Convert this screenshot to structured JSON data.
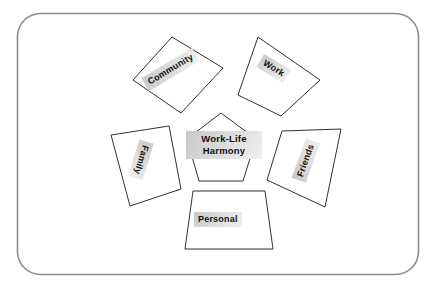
{
  "diagram": {
    "title_text": "Work-Life Harmony",
    "frame": {
      "name": "rounded-border-frame",
      "stroke_color": "#8c8c8c",
      "fill_color": "#ffffff",
      "corner_radius": 22
    },
    "center": {
      "label": "Work-Life Harmony",
      "line1": "Work-Life",
      "line2": "Harmony",
      "shape": "pentagon",
      "rotation_deg": 0
    },
    "nodes": [
      {
        "id": "community",
        "label": "Community",
        "shape": "quadrilateral",
        "rotation_deg": -31,
        "position": "top-left"
      },
      {
        "id": "work",
        "label": "Work",
        "shape": "quadrilateral",
        "rotation_deg": 31,
        "position": "top-right"
      },
      {
        "id": "friends",
        "label": "Friends",
        "shape": "quadrilateral",
        "rotation_deg": -70,
        "position": "right"
      },
      {
        "id": "personal",
        "label": "Personal",
        "shape": "trapezoid",
        "rotation_deg": 0,
        "position": "bottom"
      },
      {
        "id": "family",
        "label": "Family",
        "shape": "quadrilateral",
        "rotation_deg": 107,
        "position": "left"
      }
    ],
    "colors": {
      "shape_stroke": "#1a1a1a",
      "shape_fill": "#ffffff",
      "text": "#111111",
      "highlight_start": "#c9c9c9",
      "highlight_end": "#efefef",
      "frame_stroke": "#8c8c8c"
    }
  }
}
